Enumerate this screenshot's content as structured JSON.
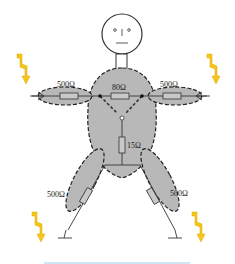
{
  "diagram": {
    "resistors": {
      "left_arm": "500Ω",
      "right_arm": "500Ω",
      "chest": "80Ω",
      "torso": "15Ω",
      "left_leg": "500Ω",
      "right_leg": "500Ω"
    },
    "icons": [
      "lightning-left-top",
      "lightning-right-top",
      "lightning-left-bottom",
      "lightning-right-bottom"
    ],
    "colors": {
      "body_fill": "#b8b8b8",
      "lightning": "#f5c518",
      "bottom_line": "#cfe6f7"
    }
  }
}
